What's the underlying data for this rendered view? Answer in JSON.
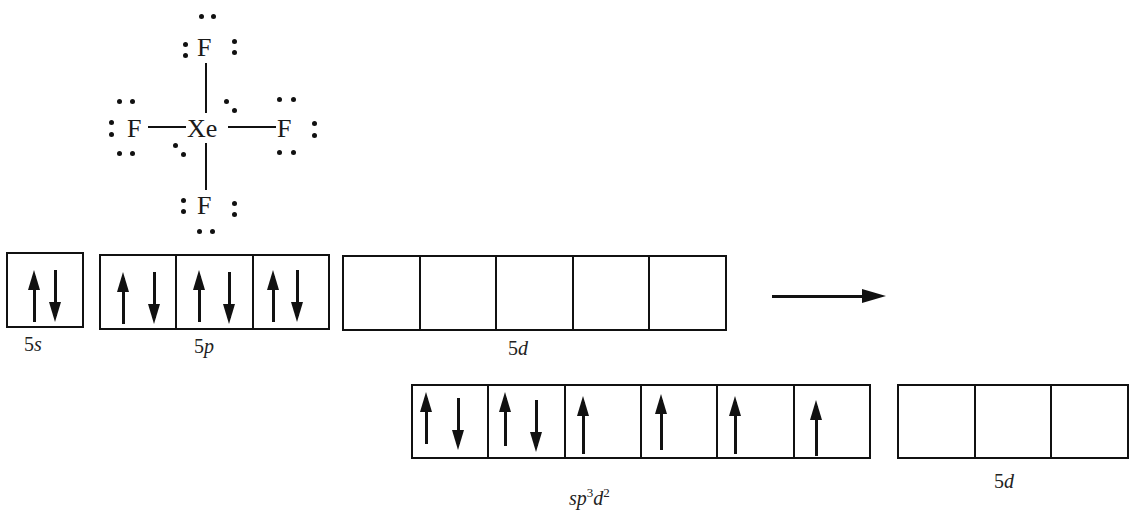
{
  "molecule": {
    "name": "XeF4 Lewis structure",
    "central_atom": "Xe",
    "ligands": [
      {
        "position": "top",
        "symbol": "F"
      },
      {
        "position": "left",
        "symbol": "F"
      },
      {
        "position": "right",
        "symbol": "F"
      },
      {
        "position": "bottom",
        "symbol": "F"
      }
    ],
    "central_lone_pairs": 2
  },
  "ground_state": {
    "orbitals": [
      {
        "label_num": "5",
        "label_sub": "s",
        "boxes": [
          [
            "up",
            "down"
          ]
        ]
      },
      {
        "label_num": "5",
        "label_sub": "p",
        "boxes": [
          [
            "up",
            "down"
          ],
          [
            "up",
            "down"
          ],
          [
            "up",
            "down"
          ]
        ]
      },
      {
        "label_num": "5",
        "label_sub": "d",
        "boxes": [
          [],
          [],
          [],
          [],
          []
        ]
      }
    ]
  },
  "transition_arrow": "right-arrow",
  "hybridized_state": {
    "hybrid": {
      "label": "sp3d2",
      "label_parts": {
        "s": "s",
        "p": "p",
        "p_sup": "3",
        "d": "d",
        "d_sup": "2"
      },
      "boxes": [
        [
          "up",
          "down"
        ],
        [
          "up",
          "down"
        ],
        [
          "up"
        ],
        [
          "up"
        ],
        [
          "up"
        ],
        [
          "up"
        ]
      ]
    },
    "remaining": {
      "label_num": "5",
      "label_sub": "d",
      "boxes": [
        [],
        [],
        []
      ]
    }
  },
  "labels": {
    "xe": "Xe",
    "f": "F",
    "s5": "5",
    "s5_sub": "s",
    "p5": "5",
    "p5_sub": "p",
    "d5": "5",
    "d5_sub": "d",
    "d5b": "5",
    "d5b_sub": "d",
    "hyb_s": "s",
    "hyb_p": "p",
    "hyb_p_sup": "3",
    "hyb_d": "d",
    "hyb_d_sup": "2"
  }
}
